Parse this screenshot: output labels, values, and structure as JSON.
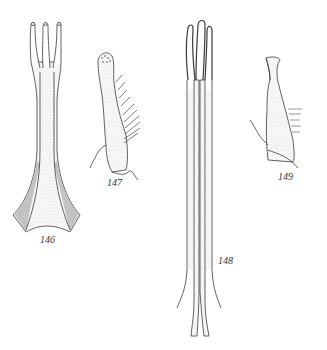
{
  "plate": {
    "description": "Line-drawing plate of four anatomical structures (stippled pen illustrations)",
    "background": "#ffffff",
    "ink_color": "#3a3a3a",
    "stipple_color": "#9a9a9a"
  },
  "figures": [
    {
      "id": "146",
      "label": "146",
      "shape": "three-pronged fork with long stem flaring to broad concave base"
    },
    {
      "id": "147",
      "label": "147",
      "shape": "curved club-shaped lobe with setae along right margin"
    },
    {
      "id": "148",
      "label": "148",
      "shape": "very long slender three-pronged structure tapering to two points"
    },
    {
      "id": "149",
      "label": "149",
      "shape": "hooked rectangular lobe with short setae on right edge"
    }
  ]
}
